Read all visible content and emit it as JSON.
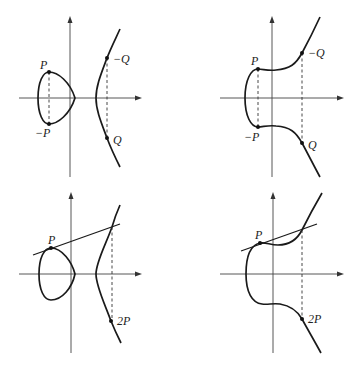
{
  "figure": {
    "panels": [
      {
        "id": "top-left",
        "description": "Point negation on curve with two components",
        "labels": {
          "p": "P",
          "neg_p": "−P",
          "neg_q": "−Q",
          "q": "Q"
        }
      },
      {
        "id": "top-right",
        "description": "Point negation on curve with one component",
        "labels": {
          "p": "P",
          "neg_p": "−P",
          "neg_q": "−Q",
          "q": "Q"
        }
      },
      {
        "id": "bottom-left",
        "description": "Point doubling via tangent line, two-component curve",
        "labels": {
          "p": "P",
          "two_p": "2P"
        }
      },
      {
        "id": "bottom-right",
        "description": "Point doubling via tangent line, one-component curve",
        "labels": {
          "p": "P",
          "two_p": "2P"
        }
      }
    ],
    "colors": {
      "curve": "#1a1a1a",
      "axis": "#444444",
      "background": "#ffffff"
    }
  }
}
